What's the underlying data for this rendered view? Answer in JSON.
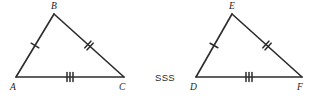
{
  "figure": {
    "background_color": "#ffffff",
    "stroke_color": "#2b2b2b",
    "label_color": "#1d1d1d",
    "criterion": {
      "label": "SSS",
      "x": 155,
      "y": 81
    },
    "triangles": [
      {
        "name": "triangle-abc",
        "vertices": [
          {
            "label": "A",
            "x": 16,
            "y": 77,
            "label_x": 10,
            "label_y": 90
          },
          {
            "label": "B",
            "x": 54,
            "y": 14,
            "label_x": 51,
            "label_y": 9
          },
          {
            "label": "C",
            "x": 124,
            "y": 77,
            "label_x": 119,
            "label_y": 90
          }
        ],
        "sides": [
          {
            "name": "side-ab",
            "from": "A",
            "to": "B",
            "ticks": 1
          },
          {
            "name": "side-bc",
            "from": "B",
            "to": "C",
            "ticks": 2
          },
          {
            "name": "side-ac",
            "from": "A",
            "to": "C",
            "ticks": 3
          }
        ]
      },
      {
        "name": "triangle-def",
        "vertices": [
          {
            "label": "D",
            "x": 196,
            "y": 77,
            "label_x": 190,
            "label_y": 90
          },
          {
            "label": "E",
            "x": 232,
            "y": 14,
            "label_x": 229,
            "label_y": 9
          },
          {
            "label": "F",
            "x": 302,
            "y": 77,
            "label_x": 297,
            "label_y": 90
          }
        ],
        "sides": [
          {
            "name": "side-de",
            "from": "D",
            "to": "E",
            "ticks": 1
          },
          {
            "name": "side-ef",
            "from": "E",
            "to": "F",
            "ticks": 2
          },
          {
            "name": "side-df",
            "from": "D",
            "to": "F",
            "ticks": 3
          }
        ]
      }
    ],
    "tick_style": {
      "length": 9,
      "spacing": 3
    }
  }
}
